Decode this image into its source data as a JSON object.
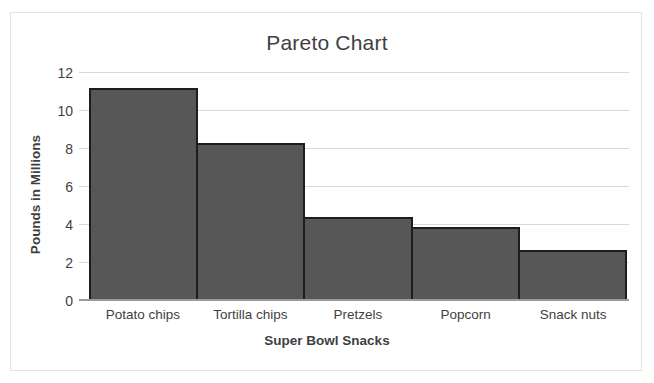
{
  "chart_data": {
    "type": "bar",
    "title": "Pareto Chart",
    "xlabel": "Super Bowl Snacks",
    "ylabel": "Pounds in Millions",
    "categories": [
      "Potato chips",
      "Tortilla chips",
      "Pretzels",
      "Popcorn",
      "Snack nuts"
    ],
    "values": [
      11.2,
      8.3,
      4.4,
      3.9,
      2.7
    ],
    "ylim": [
      0,
      12
    ],
    "ytick_labels": [
      "0",
      "2",
      "4",
      "6",
      "8",
      "10",
      "12"
    ],
    "ytick_values": [
      0,
      2,
      4,
      6,
      8,
      10,
      12
    ],
    "grid": "horizontal",
    "legend": "none",
    "bar_color": "#575757",
    "bar_border_color": "#1d1d1d",
    "gridline_color": "#d9d9d9",
    "axis_color": "#9a9a9a",
    "text_color": "#3f3f3f",
    "background": "#ffffff",
    "border_color": "#e3e3e3"
  }
}
